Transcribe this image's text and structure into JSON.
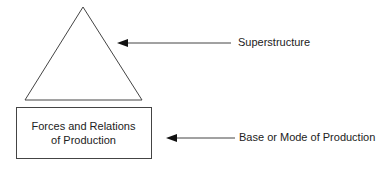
{
  "diagram": {
    "superstructure_label": "Superstructure",
    "base_label": "Base or Mode of Production",
    "box_text": {
      "line1": "Forces and Relations",
      "line2": "of Production"
    },
    "shapes": {
      "triangle": "superstructure-triangle",
      "box": "base-box",
      "arrows": [
        "superstructure-arrow",
        "base-arrow"
      ]
    },
    "colors": {
      "stroke": "#444444",
      "text": "#222222",
      "background": "#ffffff"
    }
  }
}
